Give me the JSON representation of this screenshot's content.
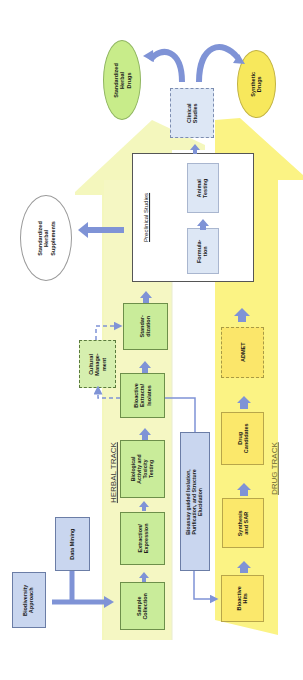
{
  "diagram": {
    "orientation": "rotated-90-ccw",
    "tracks": {
      "herbal": {
        "label": "HERBAL TRACK",
        "color": "#f2f5b0"
      },
      "drug": {
        "label": "DRUG TRACK",
        "color": "#fbf27a"
      }
    },
    "inputs": {
      "biodiversity": "Biodiversity\nApproach",
      "data_mining": "Data Mining"
    },
    "herbal_steps": {
      "sample_collection": "Sample\nCollection",
      "extraction": "Extraction/\nExpression",
      "biological_activity": "Biological\nActivity and\nToxicity\nTesting",
      "bioactive_extracts": "Bioactive\nExtracts/\nIsolates",
      "cultural_management": "Cultural\nManage-\nment",
      "standardization": "Standar-\ndization"
    },
    "bioassay": "Bioassay guided Isolation,\nPurification, and Structure\nElucidation",
    "drug_steps": {
      "bioactive_hits": "Bioactive\nHits",
      "synthesis_sar": "Synthesis\nand SAR",
      "drug_candidates": "Drug\nCandidates",
      "admet": "ADMET"
    },
    "preclinical": {
      "title": "Preclinical Studies",
      "formulation": "Formula-\ntion",
      "animal_testing": "Animal\nTesting"
    },
    "clinical": "Clinical\nStudies",
    "outputs": {
      "std_herbal_drugs": "Standardized\nHerbal\nDrugs",
      "synthetic_drugs": "Synthetic\nDrugs",
      "std_herbal_supplements": "Standardized\nHerbal\nSupplements"
    },
    "colors": {
      "arrow": "#7f93d6",
      "green_box": "#c9ec9a",
      "blue_box": "#c9d6ef",
      "yellow_box": "#fbe86b",
      "herbal_ellipse": "#c8ec8a",
      "drug_ellipse": "#f7e85c"
    }
  }
}
